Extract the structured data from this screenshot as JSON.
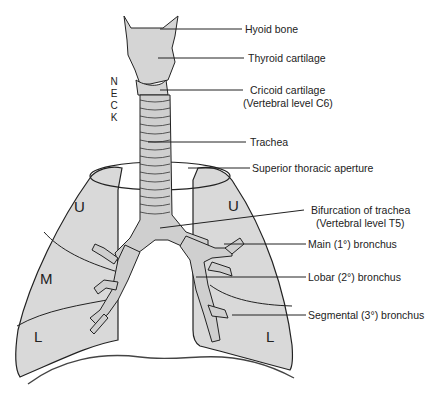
{
  "figure": {
    "side_label": [
      "N",
      "E",
      "C",
      "K"
    ],
    "labels": {
      "hyoid": "Hyoid bone",
      "thyroid": "Thyroid cartilage",
      "cricoid_1": "Cricoid cartilage",
      "cricoid_2": "(Vertebral level C6)",
      "trachea": "Trachea",
      "aperture": "Superior thoracic aperture",
      "bifurcation_1": "Bifurcation of trachea",
      "bifurcation_2": "(Vertebral level T5)",
      "main_bronchus": "Main (1°) bronchus",
      "lobar_bronchus": "Lobar (2°) bronchus",
      "segmental_bronchus": "Segmental (3°) bronchus"
    },
    "lobes": {
      "right_upper": "U",
      "right_middle": "M",
      "right_lower": "L",
      "left_upper": "U",
      "left_lower": "L"
    },
    "colors": {
      "lung_fill": "#d9d9d9",
      "airway_fill": "#cfcfcf",
      "outline": "#222222"
    }
  }
}
